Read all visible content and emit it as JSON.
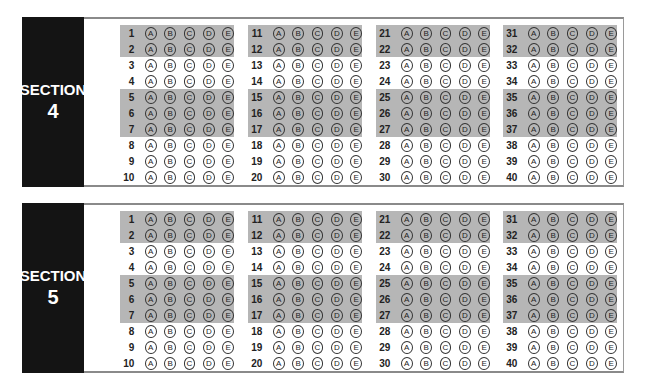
{
  "choices": [
    "A",
    "B",
    "C",
    "D",
    "E"
  ],
  "colors": {
    "label_bg": "#141414",
    "shade": "#b6b6b6",
    "border": "#8a8a8a"
  },
  "shaded_row_indices": [
    0,
    1,
    4,
    5,
    6
  ],
  "sections": [
    {
      "word": "SECTION",
      "number": "4",
      "columns": [
        {
          "questions": [
            "1",
            "2",
            "3",
            "4",
            "5",
            "6",
            "7",
            "8",
            "9",
            "10"
          ]
        },
        {
          "questions": [
            "11",
            "12",
            "13",
            "14",
            "15",
            "16",
            "17",
            "18",
            "19",
            "20"
          ]
        },
        {
          "questions": [
            "21",
            "22",
            "23",
            "24",
            "25",
            "26",
            "27",
            "28",
            "29",
            "30"
          ]
        },
        {
          "questions": [
            "31",
            "32",
            "33",
            "34",
            "35",
            "36",
            "37",
            "38",
            "39",
            "40"
          ]
        }
      ]
    },
    {
      "word": "SECTION",
      "number": "5",
      "columns": [
        {
          "questions": [
            "1",
            "2",
            "3",
            "4",
            "5",
            "6",
            "7",
            "8",
            "9",
            "10"
          ]
        },
        {
          "questions": [
            "11",
            "12",
            "13",
            "14",
            "15",
            "16",
            "17",
            "18",
            "19",
            "20"
          ]
        },
        {
          "questions": [
            "21",
            "22",
            "23",
            "24",
            "25",
            "26",
            "27",
            "28",
            "29",
            "30"
          ]
        },
        {
          "questions": [
            "31",
            "32",
            "33",
            "34",
            "35",
            "36",
            "37",
            "38",
            "39",
            "40"
          ]
        }
      ]
    }
  ]
}
